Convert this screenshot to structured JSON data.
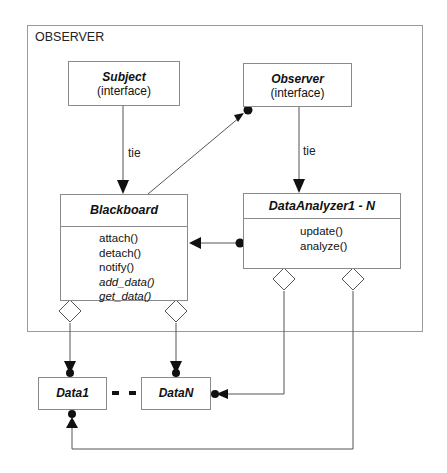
{
  "diagram": {
    "frame_label": "OBSERVER",
    "nodes": {
      "subject": {
        "title": "Subject",
        "stereotype": "(interface)"
      },
      "observer": {
        "title": "Observer",
        "stereotype": "(interface)"
      },
      "blackboard": {
        "title": "Blackboard",
        "operations": [
          "attach()",
          "detach()",
          "notify()",
          "add_data()",
          "get_data()"
        ]
      },
      "data_analyzer": {
        "title": "DataAnalyzer1 - N",
        "operations": [
          "update()",
          "analyze()"
        ]
      },
      "data1": {
        "title": "Data1"
      },
      "dataN": {
        "title": "DataN"
      }
    },
    "edges": [
      {
        "from": "subject",
        "to": "blackboard",
        "label": "tie",
        "type": "arrow"
      },
      {
        "from": "observer",
        "to": "data_analyzer",
        "label": "tie",
        "type": "arrow"
      },
      {
        "from": "blackboard",
        "to": "observer",
        "label": "",
        "type": "arrow-dot"
      },
      {
        "from": "data_analyzer",
        "to": "blackboard",
        "label": "",
        "type": "dot-arrow"
      },
      {
        "from": "blackboard",
        "to": "data1",
        "label": "",
        "type": "aggregation"
      },
      {
        "from": "blackboard",
        "to": "dataN",
        "label": "",
        "type": "aggregation"
      },
      {
        "from": "data_analyzer",
        "to": "dataN",
        "label": "",
        "type": "aggregation"
      },
      {
        "from": "data_analyzer",
        "to": "data1",
        "label": "",
        "type": "aggregation"
      },
      {
        "from": "data1",
        "to": "dataN",
        "label": "",
        "type": "dashed"
      }
    ],
    "tie_labels": [
      "tie",
      "tie"
    ],
    "colors": {
      "line": "#555555",
      "box_border": "#8a8a8a",
      "frame_border": "#9a9a9a"
    }
  }
}
